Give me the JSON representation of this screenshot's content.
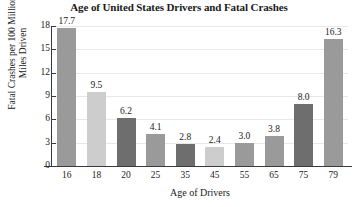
{
  "chart_data": {
    "type": "bar",
    "title": "Age of United States Drivers and Fatal Crashes",
    "xlabel": "Age of Drivers",
    "ylabel": "Fatal Crashes per 100 Million\nMiles Driven",
    "categories": [
      "16",
      "18",
      "20",
      "25",
      "35",
      "45",
      "55",
      "65",
      "75",
      "79"
    ],
    "values": [
      17.7,
      9.5,
      6.2,
      4.1,
      2.8,
      2.4,
      3.0,
      3.8,
      8.0,
      16.3
    ],
    "value_labels": [
      "17.7",
      "9.5",
      "6.2",
      "4.1",
      "2.8",
      "2.4",
      "3.0",
      "3.8",
      "8.0",
      "16.3"
    ],
    "bar_colors": [
      "#9a9a9a",
      "#cdcdcd",
      "#6e6e6e",
      "#9a9a9a",
      "#6e6e6e",
      "#cdcdcd",
      "#9a9a9a",
      "#9a9a9a",
      "#6e6e6e",
      "#9a9a9a"
    ],
    "ylim": [
      0,
      18
    ],
    "yticks": [
      "0",
      "3",
      "6",
      "9",
      "12",
      "15",
      "18"
    ],
    "ytick_values": [
      0,
      3,
      6,
      9,
      12,
      15,
      18
    ],
    "grid": true,
    "grid_color": "#e8e8e8",
    "legend": null,
    "axis_color": "#3a3a3a",
    "background": "#ffffff"
  }
}
